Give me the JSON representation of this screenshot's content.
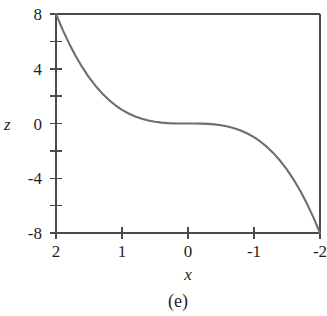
{
  "figure": {
    "caption": "(e)",
    "background_color": "#ffffff",
    "axis_color": "#4a4a4a",
    "curve_color": "#6e6e6e",
    "text_color": "#1f1f1f"
  },
  "chart_data": {
    "type": "line",
    "title": "",
    "subtitle": "",
    "caption": "(e)",
    "xlabel": "x",
    "ylabel": "z",
    "xlim": [
      2,
      -2
    ],
    "ylim": [
      -8,
      8
    ],
    "x_axis_reversed": true,
    "grid": false,
    "legend": null,
    "x_ticks": [
      2,
      1,
      0,
      -1,
      -2
    ],
    "x_tick_labels": [
      "2",
      "1",
      "0",
      "-1",
      "-2"
    ],
    "y_ticks": [
      8,
      6,
      4,
      2,
      0,
      -2,
      -4,
      -6,
      -8
    ],
    "y_tick_labels": [
      "8",
      "",
      "4",
      "",
      "0",
      "",
      "-4",
      "",
      "-8"
    ],
    "y_labeled_ticks": [
      8,
      4,
      0,
      -4,
      -8
    ],
    "y_labeled_tick_labels": [
      "8",
      "4",
      "0",
      "-4",
      "-8"
    ],
    "relation": "z = x^3",
    "series": [
      {
        "name": "z = x^3",
        "color": "#6e6e6e",
        "x": [
          2.0,
          1.9,
          1.8,
          1.7,
          1.6,
          1.5,
          1.4,
          1.3,
          1.2,
          1.1,
          1.0,
          0.9,
          0.8,
          0.7,
          0.6,
          0.5,
          0.4,
          0.3,
          0.2,
          0.1,
          0.0,
          -0.1,
          -0.2,
          -0.3,
          -0.4,
          -0.5,
          -0.6,
          -0.7,
          -0.8,
          -0.9,
          -1.0,
          -1.1,
          -1.2,
          -1.3,
          -1.4,
          -1.5,
          -1.6,
          -1.7,
          -1.8,
          -1.9,
          -2.0
        ],
        "y": [
          8.0,
          6.859,
          5.832,
          4.913,
          4.096,
          3.375,
          2.744,
          2.197,
          1.728,
          1.331,
          1.0,
          0.729,
          0.512,
          0.343,
          0.216,
          0.125,
          0.064,
          0.027,
          0.008,
          0.001,
          0.0,
          -0.001,
          -0.008,
          -0.027,
          -0.064,
          -0.125,
          -0.216,
          -0.343,
          -0.512,
          -0.729,
          -1.0,
          -1.331,
          -1.728,
          -2.197,
          -2.744,
          -3.375,
          -4.096,
          -4.913,
          -5.832,
          -6.859,
          -8.0
        ]
      }
    ]
  }
}
